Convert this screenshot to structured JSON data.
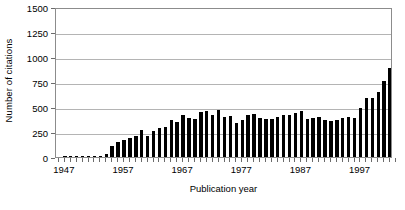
{
  "chart_data": {
    "type": "bar",
    "title": "",
    "xlabel": "Publication year",
    "ylabel": "Number of citations",
    "ylim": [
      0,
      1500
    ],
    "yticks": [
      0,
      250,
      500,
      750,
      1000,
      1250,
      1500
    ],
    "xtick_labels": [
      "1947",
      "1957",
      "1967",
      "1977",
      "1987",
      "1997"
    ],
    "xtick_values": [
      1947,
      1957,
      1967,
      1977,
      1987,
      1997
    ],
    "xlim": [
      1946,
      2003
    ],
    "grid": "horizontal",
    "legend": "none",
    "bar_color": "#000000",
    "categories": [
      1947,
      1948,
      1949,
      1950,
      1951,
      1952,
      1953,
      1954,
      1955,
      1956,
      1957,
      1958,
      1959,
      1960,
      1961,
      1962,
      1963,
      1964,
      1965,
      1966,
      1967,
      1968,
      1969,
      1970,
      1971,
      1972,
      1973,
      1974,
      1975,
      1976,
      1977,
      1978,
      1979,
      1980,
      1981,
      1982,
      1983,
      1984,
      1985,
      1986,
      1987,
      1988,
      1989,
      1990,
      1991,
      1992,
      1993,
      1994,
      1995,
      1996,
      1997,
      1998,
      1999,
      2000,
      2001,
      2002
    ],
    "values": [
      3,
      4,
      5,
      6,
      7,
      8,
      10,
      30,
      115,
      150,
      170,
      190,
      210,
      270,
      215,
      260,
      290,
      300,
      375,
      355,
      425,
      395,
      385,
      455,
      460,
      425,
      470,
      405,
      415,
      345,
      370,
      420,
      430,
      395,
      385,
      385,
      400,
      425,
      425,
      440,
      460,
      385,
      390,
      400,
      375,
      365,
      375,
      395,
      400,
      390,
      490,
      595,
      595,
      650,
      765,
      895
    ],
    "values_tail_extra": [
      1035,
      1060,
      1140,
      1180
    ]
  }
}
